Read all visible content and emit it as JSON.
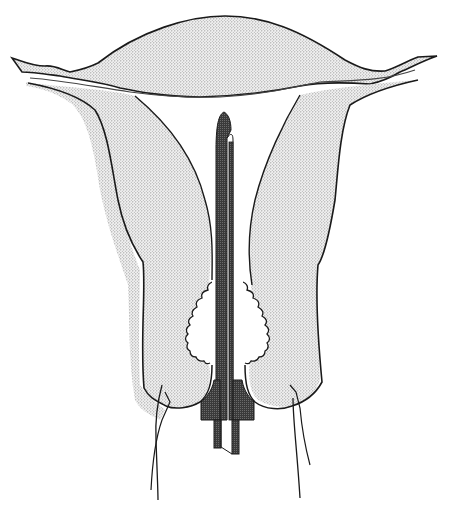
{
  "figure": {
    "type": "anatomical-illustration",
    "colors": {
      "background": "#ffffff",
      "outline": "#1a1a1a",
      "tissue_stipple": "#d9d9d9",
      "device": "#3a3a3a"
    },
    "labels": []
  }
}
